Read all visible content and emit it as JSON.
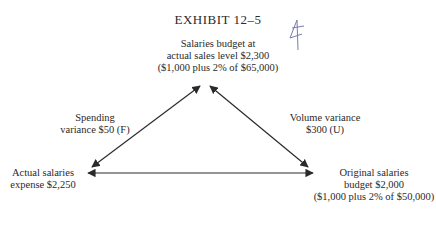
{
  "title": "EXHIBIT 12–5",
  "nodes": {
    "top": {
      "line1": "Salaries budget at",
      "line2": "actual sales level $2,300",
      "line3": "($1,000 plus 2% of $65,000)"
    },
    "left": {
      "line1": "Actual salaries",
      "line2": "expense $2,250"
    },
    "right": {
      "line1": "Original salaries",
      "line2": "budget $2,000",
      "line3": "($1,000 plus 2% of $50,000)"
    }
  },
  "edges": {
    "left": {
      "line1": "Spending",
      "line2": "variance $50 (F)"
    },
    "right": {
      "line1": "Volume variance",
      "line2": "$300 (U)"
    }
  },
  "colors": {
    "ink": "#2a2a2a",
    "annotation": "#7a7ab0"
  }
}
